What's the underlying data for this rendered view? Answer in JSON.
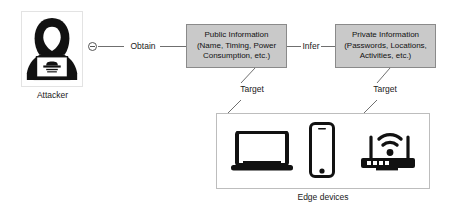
{
  "diagram": {
    "colors": {
      "box_fill": "#c9c9c9",
      "box_border": "#8a8a8a",
      "line": "#6f6f6f",
      "icon": "#111111",
      "panel_border": "#bdbdbd",
      "background": "#ffffff"
    },
    "actor": {
      "label": "Attacker",
      "icon": "hooded-attacker-with-laptop-icon"
    },
    "connectors": {
      "obtain": {
        "label": "Obtain",
        "node_icon": "connector-node-icon"
      },
      "infer": {
        "label": "Infer"
      },
      "target_left": {
        "label": "Target"
      },
      "target_right": {
        "label": "Target"
      }
    },
    "nodes": [
      {
        "id": "public-information",
        "line1": "Public Information",
        "line2": "(Name, Timing, Power",
        "line3": "Consumption, etc.)"
      },
      {
        "id": "private-information",
        "line1": "Private Information",
        "line2": "(Passwords, Locations,",
        "line3": "Activities, etc.)"
      }
    ],
    "edge_devices": {
      "label": "Edge devices",
      "items": [
        {
          "id": "laptop",
          "icon": "laptop-icon"
        },
        {
          "id": "smartphone",
          "icon": "smartphone-icon"
        },
        {
          "id": "router",
          "icon": "wifi-router-icon"
        }
      ]
    }
  }
}
